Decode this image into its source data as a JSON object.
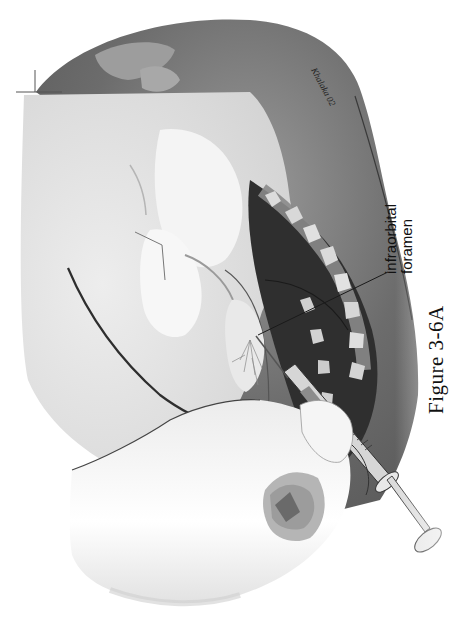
{
  "figure": {
    "caption": "Figure 3-6A",
    "orientation": "rotated 90° (text reads bottom-to-top)",
    "labels": {
      "infraorbital_line1": "infraorbital",
      "infraorbital_line2": "foramen"
    },
    "signature": "Khalaka 02",
    "palette": {
      "background": "#ffffff",
      "skin_light": "#e6e6e6",
      "skin_mid": "#cfcfcf",
      "muzzle_dark": "#6e6e6e",
      "muzzle_darker": "#4a4a4a",
      "mouth_black": "#2a2a2a",
      "teeth": "#d9d9d9",
      "gums": "#8a8a8a",
      "hand_white": "#f7f7f7",
      "outline": "#333333"
    }
  }
}
